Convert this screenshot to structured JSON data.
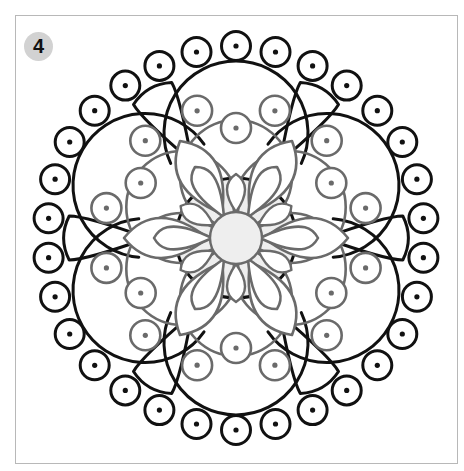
{
  "page": {
    "badge_number": "4"
  },
  "colors": {
    "outline_dark": "#111111",
    "outline_gray": "#6a6a6a",
    "center_fill": "#eeeeee",
    "badge_fill": "#d2d2d2",
    "frame_border": "#b8b8b8"
  },
  "mandala": {
    "center": [
      236,
      238
    ],
    "symmetry": 6,
    "outer_dotted_circles": 30,
    "gray_dotted_circles": 18,
    "inner_petals": 6
  }
}
